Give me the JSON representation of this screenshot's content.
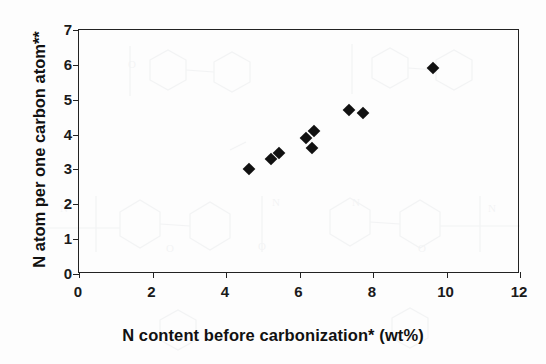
{
  "chart_data": {
    "type": "scatter",
    "title": "",
    "xlabel": "N content  before carbonization* (wt%)",
    "ylabel": "N atom per one carbon atom**",
    "xlim": [
      0,
      12
    ],
    "ylim": [
      0,
      7
    ],
    "xticks": [
      0,
      2,
      4,
      6,
      8,
      10,
      12
    ],
    "yticks": [
      0,
      1,
      2,
      3,
      4,
      5,
      6,
      7
    ],
    "grid": false,
    "legend": null,
    "marker": "filled-diamond",
    "marker_color": "#111111",
    "points": [
      {
        "x": 4.62,
        "y": 3.01
      },
      {
        "x": 5.22,
        "y": 3.3
      },
      {
        "x": 5.43,
        "y": 3.47
      },
      {
        "x": 6.17,
        "y": 3.9
      },
      {
        "x": 6.39,
        "y": 4.1
      },
      {
        "x": 6.33,
        "y": 3.61
      },
      {
        "x": 7.34,
        "y": 4.7
      },
      {
        "x": 7.72,
        "y": 4.61
      },
      {
        "x": 9.62,
        "y": 5.9
      }
    ]
  }
}
